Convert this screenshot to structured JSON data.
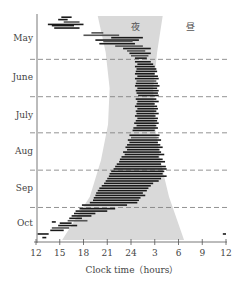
{
  "chart_data": {
    "type": "bar",
    "subtype": "actogram-floating-bars",
    "title": "",
    "xlabel": "Clock time（hours）",
    "ylabel": "",
    "x_ticks": [
      "12",
      "15",
      "18",
      "21",
      "24",
      "3",
      "6",
      "9",
      "12"
    ],
    "x_range_hours_from_noon": [
      0,
      24
    ],
    "y_months": [
      "May",
      "June",
      "July",
      "Aug",
      "Sep",
      "Oct"
    ],
    "y_range_day_index": [
      0,
      186
    ],
    "month_boundaries_day_index": [
      36,
      67,
      97,
      128,
      159
    ],
    "month_label_day_index": [
      18,
      51,
      82,
      112,
      143,
      172
    ],
    "grid": "dashed month dividers",
    "band_labels": {
      "night": "夜",
      "day": "昼"
    },
    "night_band": {
      "description": "shaded night period (sunset to sunrise), hours from noon",
      "points": [
        {
          "day": 0,
          "start": 7.8,
          "end": 16.0
        },
        {
          "day": 30,
          "start": 8.8,
          "end": 15.3
        },
        {
          "day": 60,
          "start": 9.3,
          "end": 14.8
        },
        {
          "day": 90,
          "start": 9.1,
          "end": 15.0
        },
        {
          "day": 120,
          "start": 8.2,
          "end": 15.7
        },
        {
          "day": 150,
          "start": 6.8,
          "end": 16.8
        },
        {
          "day": 186,
          "start": 3.3,
          "end": 18.7
        }
      ]
    },
    "activity_bars": [
      {
        "day": 1,
        "start": 3.2,
        "end": 4.5,
        "tone": "dark"
      },
      {
        "day": 3,
        "start": 2.8,
        "end": 4.0,
        "tone": "dark"
      },
      {
        "day": 5,
        "start": 3.5,
        "end": 5.5,
        "tone": "mid"
      },
      {
        "day": 7,
        "start": 1.5,
        "end": 6.0,
        "tone": "dark"
      },
      {
        "day": 8,
        "start": 2.0,
        "end": 4.8,
        "tone": "dark"
      },
      {
        "day": 10,
        "start": 2.3,
        "end": 5.5,
        "tone": "dark"
      },
      {
        "day": 14,
        "start": 7.0,
        "end": 8.5,
        "tone": "mid"
      },
      {
        "day": 16,
        "start": 6.0,
        "end": 10.5,
        "tone": "mid"
      },
      {
        "day": 18,
        "start": 9.5,
        "end": 13.5,
        "tone": "dark"
      },
      {
        "day": 20,
        "start": 7.5,
        "end": 13.0,
        "tone": "dark"
      },
      {
        "day": 21,
        "start": 8.5,
        "end": 12.2,
        "tone": "mid"
      },
      {
        "day": 23,
        "start": 8.0,
        "end": 12.5,
        "tone": "dark"
      },
      {
        "day": 25,
        "start": 10.0,
        "end": 13.5,
        "tone": "mid"
      },
      {
        "day": 27,
        "start": 11.0,
        "end": 14.5,
        "tone": "dark"
      },
      {
        "day": 29,
        "start": 11.5,
        "end": 13.8,
        "tone": "mid"
      },
      {
        "day": 31,
        "start": 11.8,
        "end": 14.5,
        "tone": "dark"
      },
      {
        "day": 33,
        "start": 12.0,
        "end": 14.2,
        "tone": "mid"
      },
      {
        "day": 35,
        "start": 12.5,
        "end": 14.0,
        "tone": "dark"
      },
      {
        "day": 38,
        "start": 12.5,
        "end": 14.5,
        "tone": "dark"
      },
      {
        "day": 40,
        "start": 12.8,
        "end": 14.8,
        "tone": "dark"
      },
      {
        "day": 42,
        "start": 12.5,
        "end": 15.0,
        "tone": "dark"
      },
      {
        "day": 44,
        "start": 12.7,
        "end": 15.2,
        "tone": "dark"
      },
      {
        "day": 46,
        "start": 12.6,
        "end": 15.3,
        "tone": "dark"
      },
      {
        "day": 48,
        "start": 12.5,
        "end": 15.0,
        "tone": "dark"
      },
      {
        "day": 50,
        "start": 12.8,
        "end": 15.4,
        "tone": "dark"
      },
      {
        "day": 52,
        "start": 12.5,
        "end": 15.5,
        "tone": "dark"
      },
      {
        "day": 54,
        "start": 12.7,
        "end": 15.2,
        "tone": "mid"
      },
      {
        "day": 56,
        "start": 12.6,
        "end": 15.4,
        "tone": "dark"
      },
      {
        "day": 58,
        "start": 12.5,
        "end": 15.6,
        "tone": "dark"
      },
      {
        "day": 60,
        "start": 12.8,
        "end": 15.3,
        "tone": "dark"
      },
      {
        "day": 62,
        "start": 12.6,
        "end": 15.5,
        "tone": "dark"
      },
      {
        "day": 64,
        "start": 12.7,
        "end": 15.4,
        "tone": "dark"
      },
      {
        "day": 66,
        "start": 12.9,
        "end": 15.5,
        "tone": "dark"
      },
      {
        "day": 69,
        "start": 12.6,
        "end": 15.2,
        "tone": "dark"
      },
      {
        "day": 71,
        "start": 12.8,
        "end": 15.5,
        "tone": "dark"
      },
      {
        "day": 73,
        "start": 12.7,
        "end": 15.0,
        "tone": "dark"
      },
      {
        "day": 75,
        "start": 12.5,
        "end": 15.3,
        "tone": "dark"
      },
      {
        "day": 77,
        "start": 12.8,
        "end": 15.4,
        "tone": "dark"
      },
      {
        "day": 79,
        "start": 12.6,
        "end": 15.2,
        "tone": "dark"
      },
      {
        "day": 81,
        "start": 12.7,
        "end": 15.5,
        "tone": "dark"
      },
      {
        "day": 83,
        "start": 12.5,
        "end": 15.1,
        "tone": "dark"
      },
      {
        "day": 85,
        "start": 12.8,
        "end": 15.4,
        "tone": "dark"
      },
      {
        "day": 87,
        "start": 12.6,
        "end": 15.3,
        "tone": "dark"
      },
      {
        "day": 89,
        "start": 12.4,
        "end": 15.5,
        "tone": "dark"
      },
      {
        "day": 91,
        "start": 12.7,
        "end": 15.2,
        "tone": "dark"
      },
      {
        "day": 93,
        "start": 12.3,
        "end": 15.4,
        "tone": "dark"
      },
      {
        "day": 95,
        "start": 12.2,
        "end": 15.0,
        "tone": "dark"
      },
      {
        "day": 99,
        "start": 11.8,
        "end": 15.6,
        "tone": "dark"
      },
      {
        "day": 101,
        "start": 12.0,
        "end": 15.5,
        "tone": "mid"
      },
      {
        "day": 103,
        "start": 11.6,
        "end": 15.8,
        "tone": "dark"
      },
      {
        "day": 105,
        "start": 11.8,
        "end": 15.4,
        "tone": "dark"
      },
      {
        "day": 107,
        "start": 11.5,
        "end": 15.7,
        "tone": "dark"
      },
      {
        "day": 109,
        "start": 11.3,
        "end": 16.0,
        "tone": "dark"
      },
      {
        "day": 111,
        "start": 11.5,
        "end": 15.6,
        "tone": "dark"
      },
      {
        "day": 113,
        "start": 11.0,
        "end": 15.8,
        "tone": "dark"
      },
      {
        "day": 115,
        "start": 11.2,
        "end": 16.2,
        "tone": "dark"
      },
      {
        "day": 117,
        "start": 10.8,
        "end": 15.5,
        "tone": "dark"
      },
      {
        "day": 119,
        "start": 10.6,
        "end": 16.0,
        "tone": "dark"
      },
      {
        "day": 121,
        "start": 10.5,
        "end": 16.3,
        "tone": "dark"
      },
      {
        "day": 123,
        "start": 10.2,
        "end": 15.8,
        "tone": "dark"
      },
      {
        "day": 125,
        "start": 10.0,
        "end": 16.4,
        "tone": "dark"
      },
      {
        "day": 127,
        "start": 9.8,
        "end": 16.5,
        "tone": "dark"
      },
      {
        "day": 129,
        "start": 9.5,
        "end": 16.2,
        "tone": "dark"
      },
      {
        "day": 131,
        "start": 9.3,
        "end": 16.0,
        "tone": "dark"
      },
      {
        "day": 133,
        "start": 9.2,
        "end": 16.5,
        "tone": "dark"
      },
      {
        "day": 135,
        "start": 9.0,
        "end": 15.8,
        "tone": "dark"
      },
      {
        "day": 137,
        "start": 8.8,
        "end": 15.5,
        "tone": "dark"
      },
      {
        "day": 139,
        "start": 8.6,
        "end": 14.8,
        "tone": "dark"
      },
      {
        "day": 141,
        "start": 8.3,
        "end": 14.5,
        "tone": "dark"
      },
      {
        "day": 143,
        "start": 8.0,
        "end": 14.2,
        "tone": "dark"
      },
      {
        "day": 145,
        "start": 7.8,
        "end": 14.0,
        "tone": "dark"
      },
      {
        "day": 147,
        "start": 7.6,
        "end": 13.5,
        "tone": "dark"
      },
      {
        "day": 149,
        "start": 7.5,
        "end": 13.8,
        "tone": "dark"
      },
      {
        "day": 151,
        "start": 7.3,
        "end": 13.2,
        "tone": "dark"
      },
      {
        "day": 153,
        "start": 7.2,
        "end": 13.0,
        "tone": "dark"
      },
      {
        "day": 155,
        "start": 6.8,
        "end": 12.8,
        "tone": "dark"
      },
      {
        "day": 157,
        "start": 5.8,
        "end": 11.5,
        "tone": "dark"
      },
      {
        "day": 160,
        "start": 5.5,
        "end": 10.0,
        "tone": "dark"
      },
      {
        "day": 162,
        "start": 5.0,
        "end": 9.0,
        "tone": "dark"
      },
      {
        "day": 164,
        "start": 4.8,
        "end": 7.5,
        "tone": "dark"
      },
      {
        "day": 166,
        "start": 4.5,
        "end": 7.0,
        "tone": "dark"
      },
      {
        "day": 168,
        "start": 4.2,
        "end": 5.8,
        "tone": "dark"
      },
      {
        "day": 170,
        "start": 4.0,
        "end": 6.5,
        "tone": "mid"
      },
      {
        "day": 171,
        "start": 2.0,
        "end": 2.5,
        "tone": "dark"
      },
      {
        "day": 172,
        "start": 3.0,
        "end": 4.5,
        "tone": "dark"
      },
      {
        "day": 174,
        "start": 2.8,
        "end": 5.2,
        "tone": "dark"
      },
      {
        "day": 176,
        "start": 2.0,
        "end": 4.2,
        "tone": "mid"
      },
      {
        "day": 178,
        "start": 1.8,
        "end": 3.5,
        "tone": "dark"
      },
      {
        "day": 181,
        "start": 0.2,
        "end": 1.6,
        "tone": "dark"
      },
      {
        "day": 181,
        "start": 23.6,
        "end": 24.0,
        "tone": "dark"
      },
      {
        "day": 184,
        "start": 0.8,
        "end": 1.3,
        "tone": "dark"
      }
    ]
  }
}
